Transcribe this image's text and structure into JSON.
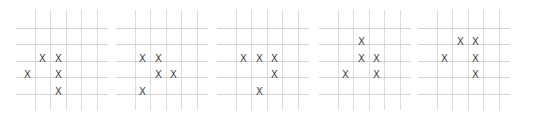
{
  "figure": {
    "mark_symbol": "X",
    "grid": {
      "rows": 6,
      "cols": 6
    },
    "colors": {
      "grid_line": "#d4d4d4",
      "mark": "#444444",
      "background": "#ffffff"
    },
    "panels": [
      {
        "label": "generation-1",
        "left": 16,
        "cells": [
          [
            3,
            1
          ],
          [
            3,
            2
          ],
          [
            4,
            0
          ],
          [
            4,
            2
          ],
          [
            5,
            2
          ]
        ]
      },
      {
        "label": "generation-2",
        "left": 116,
        "cells": [
          [
            3,
            1
          ],
          [
            3,
            2
          ],
          [
            4,
            2
          ],
          [
            4,
            3
          ],
          [
            5,
            1
          ]
        ]
      },
      {
        "label": "generation-3",
        "left": 217,
        "cells": [
          [
            3,
            1
          ],
          [
            3,
            2
          ],
          [
            3,
            3
          ],
          [
            4,
            3
          ],
          [
            5,
            2
          ]
        ]
      },
      {
        "label": "generation-4",
        "left": 319,
        "cells": [
          [
            2,
            2
          ],
          [
            3,
            2
          ],
          [
            3,
            3
          ],
          [
            4,
            1
          ],
          [
            4,
            3
          ]
        ]
      },
      {
        "label": "generation-5",
        "left": 418,
        "cells": [
          [
            2,
            2
          ],
          [
            2,
            3
          ],
          [
            3,
            1
          ],
          [
            3,
            3
          ],
          [
            4,
            3
          ]
        ]
      }
    ]
  }
}
